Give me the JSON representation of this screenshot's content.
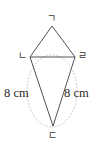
{
  "figure": {
    "type": "geometry-diagram",
    "vertices": [
      {
        "name": "top",
        "label": "ㄱ",
        "x": 52,
        "y": 26
      },
      {
        "name": "left",
        "label": "ㄴ",
        "x": 30,
        "y": 57
      },
      {
        "name": "right",
        "label": "ㄹ",
        "x": 75,
        "y": 57
      },
      {
        "name": "bottom",
        "label": "ㄷ",
        "x": 53,
        "y": 126
      }
    ],
    "edges": [
      {
        "name": "top-left-edge",
        "from": "top",
        "to": "left",
        "style": "solid"
      },
      {
        "name": "top-right-edge",
        "from": "top",
        "to": "right",
        "style": "solid"
      },
      {
        "name": "horizontal-diagonal",
        "from": "left",
        "to": "right",
        "style": "solid"
      },
      {
        "name": "bottom-left-edge",
        "from": "left",
        "to": "bottom",
        "style": "solid"
      },
      {
        "name": "bottom-right-edge",
        "from": "right",
        "to": "bottom",
        "style": "solid"
      }
    ],
    "guide_circle": {
      "name": "dotted-circle",
      "cx": 52,
      "cy": 91,
      "rx": 25,
      "ry": 36,
      "style": "dotted"
    },
    "measures": [
      {
        "name": "left-side-measure",
        "text": "8 cm"
      },
      {
        "name": "right-side-measure",
        "text": "8 cm"
      }
    ],
    "colors": {
      "stroke": "#3f3f3f",
      "guide_stroke": "#c9c9c9",
      "label_text": "#3a3a3a",
      "measure_text": "#2b2b2b",
      "background": "#ffffff"
    }
  }
}
